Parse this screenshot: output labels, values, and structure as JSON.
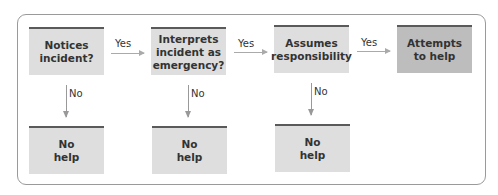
{
  "diagram": {
    "decision_nodes": [
      {
        "label": "Notices\nincident?"
      },
      {
        "label": "Interprets\nincident as\nemergency?"
      },
      {
        "label": "Assumes\nresponsibility"
      }
    ],
    "outcome_help": {
      "label": "Attempts\nto help"
    },
    "outcome_no_help": [
      {
        "label": "No\nhelp"
      },
      {
        "label": "No\nhelp"
      },
      {
        "label": "No\nhelp"
      }
    ],
    "edges": {
      "yes_label": "Yes",
      "no_label": "No"
    },
    "colors": {
      "box_fill": "#dedede",
      "final_box_fill": "#bdbdbd",
      "box_top_bar": "#5a5a5a",
      "arrow": "#aaaaaa"
    }
  }
}
